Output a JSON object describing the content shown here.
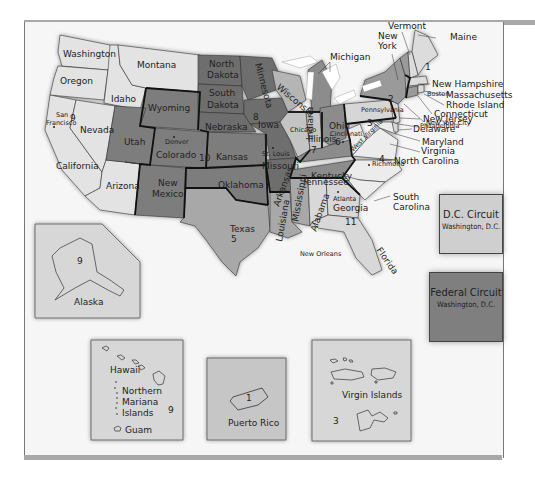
{
  "colors": {
    "circuit_light": "#e3e3e3",
    "circuit_mid_light": "#c9c9c9",
    "circuit_mid": "#a8a8a8",
    "circuit_dark": "#7d7d7d",
    "water": "#ffffff",
    "border": "#111111"
  },
  "states": {
    "washington": "Washington",
    "oregon": "Oregon",
    "idaho": "Idaho",
    "montana": "Montana",
    "california": "California",
    "nevada": "Nevada",
    "arizona": "Arizona",
    "wyoming": "Wyoming",
    "utah": "Utah",
    "colorado": "Colorado",
    "new_mexico": "New Mexico",
    "north_dakota": "North Dakota",
    "south_dakota": "South Dakota",
    "nebraska": "Nebraska",
    "kansas": "Kansas",
    "oklahoma": "Oklahoma",
    "texas": "Texas",
    "minnesota": "Minnesota",
    "iowa": "Iowa",
    "missouri": "Missouri",
    "arkansas": "Arkansas",
    "louisiana": "Louisiana",
    "mississippi": "Mississippi",
    "wisconsin": "Wisconsin",
    "illinois": "Illinois",
    "indiana": "Indiana",
    "michigan": "Michigan",
    "ohio": "Ohio",
    "kentucky": "Kentucky",
    "tennessee": "Tennessee",
    "alabama": "Alabama",
    "georgia": "Georgia",
    "florida": "Florida",
    "south_carolina": "South Carolina",
    "north_carolina": "North Carolina",
    "virginia": "Virginia",
    "west_virginia": "West Virginia",
    "maryland": "Maryland",
    "delaware": "Delaware",
    "new_jersey": "New Jersey",
    "pennsylvania": "Pennsylvania",
    "new_york": "New York",
    "connecticut": "Connecticut",
    "rhode_island": "Rhode Island",
    "massachusetts": "Massachusetts",
    "new_hampshire": "New Hampshire",
    "vermont": "Vermont",
    "maine": "Maine"
  },
  "cities": {
    "san_francisco": "San Francisco",
    "denver": "Denver",
    "st_louis": "St. Louis",
    "chicago": "Chicago",
    "cincinnati": "Cincinnati",
    "new_orleans": "New Orleans",
    "atlanta": "Atlanta",
    "richmond": "Richmond",
    "philadelphia": "Philadelphia",
    "new_york_city": "New York City",
    "boston": "Boston"
  },
  "circuit_numbers": {
    "c1": "1",
    "c2": "2",
    "c3": "3",
    "c4": "4",
    "c5": "5",
    "c6": "6",
    "c7": "7",
    "c8": "8",
    "c9": "9",
    "c10": "10",
    "c11": "11"
  },
  "special_circuits": {
    "dc": {
      "name": "D.C. Circuit",
      "location": "Washington, D.C."
    },
    "federal": {
      "name": "Federal Circuit",
      "location": "Washington, D.C."
    }
  },
  "insets": {
    "alaska": {
      "label": "Alaska",
      "circuit": "9"
    },
    "hawaii": {
      "label": "Hawaii",
      "nmi": "Northern Mariana Islands",
      "nmi_lines": [
        "Northern",
        "Mariana",
        "Islands"
      ],
      "guam": "Guam",
      "circuit": "9"
    },
    "puerto_rico": {
      "label": "Puerto Rico",
      "circuit": "1"
    },
    "virgin_islands": {
      "label": "Virgin Islands",
      "circuit": "3"
    }
  }
}
